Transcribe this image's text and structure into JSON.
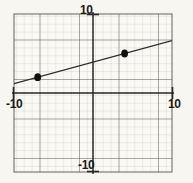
{
  "figure": {
    "background_color": "#f7f6f1",
    "plot_background_color": "#faf9f4"
  },
  "labels": {
    "y_max": "10",
    "y_min": "-10",
    "x_min": "-10",
    "x_max": "10"
  },
  "chart_data": {
    "type": "scatter",
    "title": "",
    "xlabel": "",
    "ylabel": "",
    "xlim": [
      -10,
      10
    ],
    "ylim": [
      -10,
      10
    ],
    "x_ticks": [
      -10,
      10
    ],
    "y_ticks": [
      -10,
      10
    ],
    "x_tick_labels": [
      "-10",
      "10"
    ],
    "y_tick_labels": [
      "-10",
      "10"
    ],
    "grid": true,
    "grid_minor_step": 1,
    "grid_major_step": 5,
    "grid_minor_color": "#b9b5ab",
    "grid_major_color": "#4a4a46",
    "axis_color": "#26262a",
    "legend": null,
    "points": [
      {
        "label": "point-1",
        "x": -7,
        "y": 2
      },
      {
        "label": "point-2",
        "x": 4,
        "y": 5
      }
    ],
    "series": [
      {
        "name": "fitted-line",
        "type": "line",
        "color": "#2b2b2b",
        "slope": 0.2727,
        "intercept": 3.909,
        "x_endpoints": [
          -10,
          10
        ],
        "y_endpoints": [
          1.18,
          6.64
        ]
      }
    ]
  }
}
